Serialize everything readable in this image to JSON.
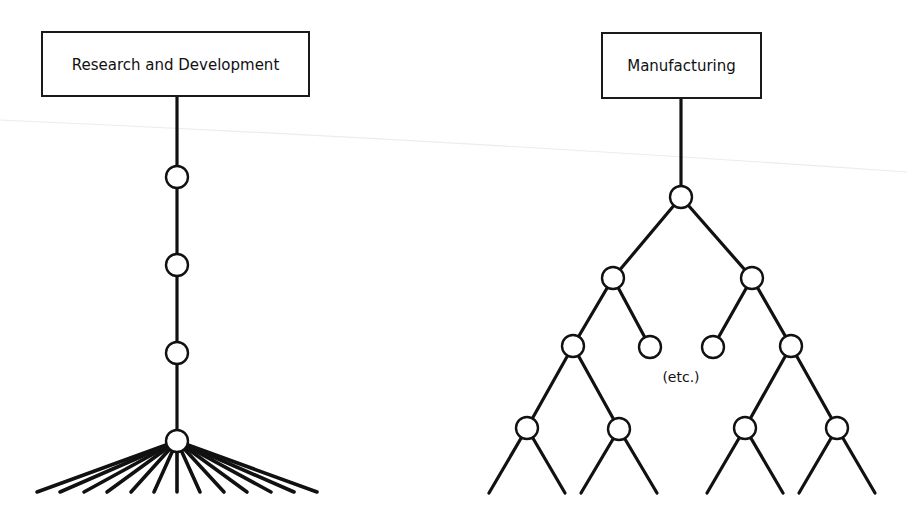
{
  "diagram": {
    "left": {
      "title": "Research and Development",
      "structure": "chain",
      "box": {
        "x": 42,
        "y": 32,
        "w": 267,
        "h": 64
      },
      "spine_x": 177,
      "nodes_y": [
        177,
        265,
        353,
        441
      ],
      "fan_endpoints_x": [
        37,
        60,
        84,
        107,
        131,
        154,
        177,
        200,
        224,
        247,
        271,
        294,
        317
      ],
      "fan_end_y": 492
    },
    "right": {
      "title": "Manufacturing",
      "structure": "binary-tree",
      "box": {
        "x": 602,
        "y": 33,
        "w": 159,
        "h": 65
      },
      "note": "(etc.)",
      "nodes": [
        {
          "id": "root",
          "x": 681,
          "y": 197
        },
        {
          "id": "l2a",
          "x": 613,
          "y": 278
        },
        {
          "id": "l2b",
          "x": 752,
          "y": 278
        },
        {
          "id": "l3a",
          "x": 573,
          "y": 346
        },
        {
          "id": "l3b",
          "x": 650,
          "y": 347
        },
        {
          "id": "l3c",
          "x": 713,
          "y": 347
        },
        {
          "id": "l3d",
          "x": 791,
          "y": 346
        },
        {
          "id": "l4a",
          "x": 527,
          "y": 428
        },
        {
          "id": "l4b",
          "x": 619,
          "y": 429
        },
        {
          "id": "l4c",
          "x": 745,
          "y": 428
        },
        {
          "id": "l4d",
          "x": 837,
          "y": 428
        }
      ],
      "leaf_end_y": 493
    }
  }
}
